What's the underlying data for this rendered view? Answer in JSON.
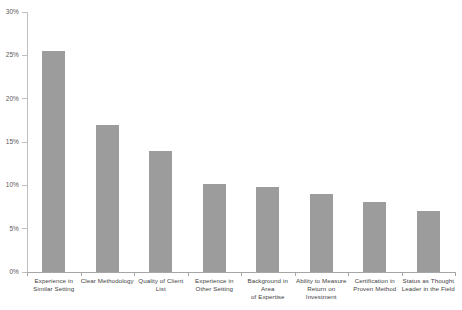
{
  "chart_data": {
    "type": "bar",
    "title": "",
    "xlabel": "",
    "ylabel": "",
    "ylim": [
      0,
      30
    ],
    "grid": false,
    "legend": "none",
    "yticks": [
      "0%",
      "5%",
      "10%",
      "15%",
      "20%",
      "25%",
      "30%"
    ],
    "ytick_values": [
      0,
      5,
      10,
      15,
      20,
      25,
      30
    ],
    "categories": [
      "Experience in Similar Setting",
      "Clear Methodology",
      "Quality of Client List",
      "Experience in Other Setting",
      "Background in Area of Expertise",
      "Ability to Measure Return on Investment",
      "Certification in Proven Method",
      "Status as Thought Leader in the Field"
    ],
    "values": [
      25.5,
      17.0,
      14.0,
      10.1,
      9.8,
      9.0,
      8.1,
      7.0
    ],
    "bar_color": "#9c9c9c",
    "axis_color": "#a6a6a6"
  },
  "axis": {
    "y_labels": [
      {
        "text": "30%",
        "value": 30
      },
      {
        "text": "25%",
        "value": 25
      },
      {
        "text": "20%",
        "value": 20
      },
      {
        "text": "15%",
        "value": 15
      },
      {
        "text": "10%",
        "value": 10
      },
      {
        "text": "5%",
        "value": 5
      },
      {
        "text": "0%",
        "value": 0
      }
    ]
  },
  "x_labels": [
    {
      "line1": "Experience in",
      "line2": "Similar Setting",
      "line3": ""
    },
    {
      "line1": "Clear Methodology",
      "line2": "",
      "line3": ""
    },
    {
      "line1": "Quality of Client",
      "line2": "List",
      "line3": ""
    },
    {
      "line1": "Experience in",
      "line2": "Other Setting",
      "line3": ""
    },
    {
      "line1": "Background in Area",
      "line2": "of Expertise",
      "line3": ""
    },
    {
      "line1": "Ability to Measure",
      "line2": "Return on",
      "line3": "Investment"
    },
    {
      "line1": "Certification in",
      "line2": "Proven Method",
      "line3": ""
    },
    {
      "line1": "Status as Thought",
      "line2": "Leader in the Field",
      "line3": ""
    }
  ]
}
